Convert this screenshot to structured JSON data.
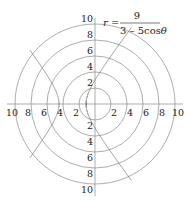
{
  "chart_data": {
    "type": "polar",
    "title": "",
    "equation": {
      "lhs": "r",
      "equals": "=",
      "numerator": "9",
      "denominator": "3 – 5cos",
      "theta": "θ",
      "A": 9,
      "B": 3,
      "C": -5
    },
    "curve_description": "Hyperbola r = 9/(3 - 5cosθ), eccentricity 5/3, focus at pole; vertices at x = -1.125 and x = -4.5",
    "vertices": [
      [
        -1.125,
        0
      ],
      [
        -4.5,
        0
      ]
    ],
    "rings": [
      2,
      4,
      6,
      8,
      10
    ],
    "rlim": [
      0,
      10
    ],
    "horizontal_tick_labels": {
      "left": [
        "10",
        "8",
        "6",
        "4",
        "2"
      ],
      "right": [
        "2",
        "4",
        "6",
        "8",
        "10"
      ]
    },
    "vertical_tick_labels": {
      "top": [
        "10",
        "8",
        "6",
        "4",
        "2"
      ],
      "bottom": [
        "2",
        "4",
        "6",
        "8",
        "10"
      ]
    },
    "grid": true,
    "colors": {
      "grid": "#8a8a8a",
      "curve": "#707070",
      "text": "#222222"
    }
  }
}
